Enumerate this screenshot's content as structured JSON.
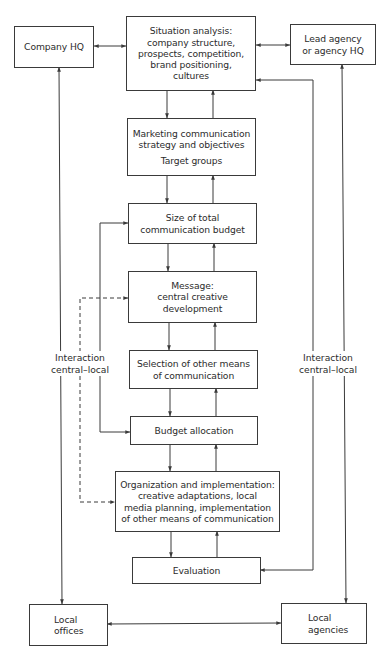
{
  "diagram": {
    "colors": {
      "stroke": "#3a3a3a",
      "text": "#2c2c2c",
      "background": "#ffffff"
    },
    "nodes": {
      "company_hq": {
        "lines": [
          "Company HQ"
        ]
      },
      "lead_agency": {
        "lines": [
          "Lead agency",
          "or agency HQ"
        ]
      },
      "situation": {
        "lines": [
          "Situation analysis:",
          "company structure,",
          "prospects, competition,",
          "brand positioning,",
          "cultures"
        ]
      },
      "strategy": {
        "lines": [
          "Marketing communication",
          "strategy and objectives"
        ],
        "sub": "Target groups"
      },
      "budget_size": {
        "lines": [
          "Size of total",
          "communication budget"
        ]
      },
      "message": {
        "lines": [
          "Message:",
          "central creative",
          "development"
        ]
      },
      "selection": {
        "lines": [
          "Selection of other means",
          "of communication"
        ]
      },
      "budget_allocation": {
        "lines": [
          "Budget allocation"
        ]
      },
      "organization": {
        "lines": [
          "Organization and implementation:",
          "creative adaptations, local",
          "media planning, implementation",
          "of other means of communication"
        ]
      },
      "evaluation": {
        "lines": [
          "Evaluation"
        ]
      },
      "local_offices": {
        "lines": [
          "Local",
          "offices"
        ]
      },
      "local_agencies": {
        "lines": [
          "Local",
          "agencies"
        ]
      }
    },
    "labels": {
      "left_interaction": [
        "Interaction",
        "central–local"
      ],
      "right_interaction": [
        "Interaction",
        "central–local"
      ]
    },
    "edges": [
      {
        "from": "company_hq",
        "to": "situation",
        "type": "bidirectional"
      },
      {
        "from": "situation",
        "to": "lead_agency",
        "type": "bidirectional"
      },
      {
        "from": "situation",
        "to": "strategy",
        "type": "down"
      },
      {
        "from": "strategy",
        "to": "situation",
        "type": "up"
      },
      {
        "from": "strategy",
        "to": "budget_size",
        "type": "down"
      },
      {
        "from": "budget_size",
        "to": "strategy",
        "type": "up"
      },
      {
        "from": "budget_size",
        "to": "message",
        "type": "down"
      },
      {
        "from": "message",
        "to": "budget_size",
        "type": "up"
      },
      {
        "from": "message",
        "to": "selection",
        "type": "down"
      },
      {
        "from": "selection",
        "to": "message",
        "type": "up"
      },
      {
        "from": "selection",
        "to": "budget_allocation",
        "type": "down"
      },
      {
        "from": "budget_allocation",
        "to": "selection",
        "type": "up"
      },
      {
        "from": "budget_allocation",
        "to": "organization",
        "type": "down"
      },
      {
        "from": "organization",
        "to": "budget_allocation",
        "type": "up"
      },
      {
        "from": "organization",
        "to": "evaluation",
        "type": "down"
      },
      {
        "from": "evaluation",
        "to": "organization",
        "type": "up"
      },
      {
        "from": "budget_allocation",
        "to": "budget_size",
        "type": "solid-feedback-left"
      },
      {
        "from": "organization",
        "to": "message",
        "type": "dashed-feedback-left"
      },
      {
        "from": "evaluation",
        "to": "situation",
        "type": "feedback-right"
      },
      {
        "from": "company_hq",
        "to": "local_offices",
        "type": "bidirectional"
      },
      {
        "from": "lead_agency",
        "to": "local_agencies",
        "type": "bidirectional"
      },
      {
        "from": "local_offices",
        "to": "local_agencies",
        "type": "bidirectional"
      }
    ]
  }
}
